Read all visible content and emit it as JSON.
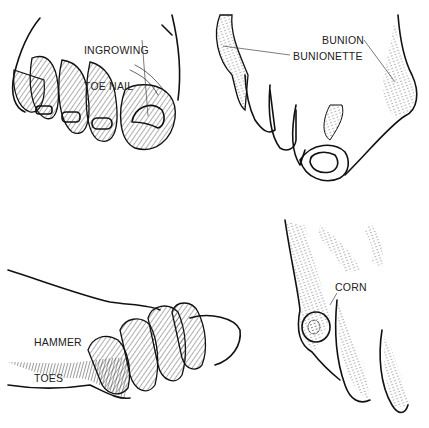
{
  "figure": {
    "panels": [
      {
        "id": "ingrowing-toe-nail",
        "label_lines": [
          "INGROWING",
          "TOE NAIL"
        ]
      },
      {
        "id": "bunion",
        "labels": [
          "BUNION",
          "BUNIONETTE"
        ]
      },
      {
        "id": "hammer-toes",
        "label_lines": [
          "HAMMER",
          "TOES"
        ]
      },
      {
        "id": "corn",
        "label_lines": [
          "CORN"
        ]
      }
    ]
  }
}
